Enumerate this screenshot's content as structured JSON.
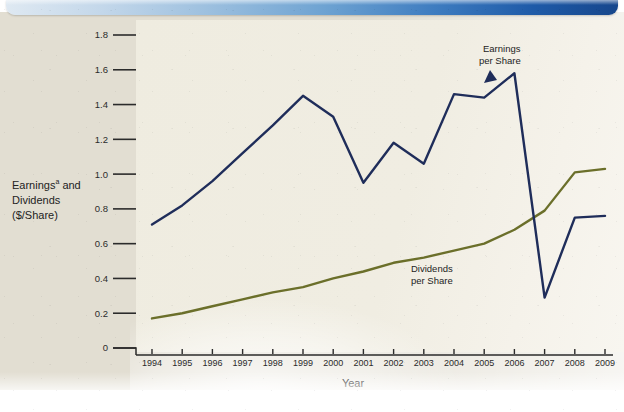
{
  "figure": {
    "banner_color_left": "#dfe9f2",
    "banner_color_right": "#16468c",
    "page_background": "#e2ded2",
    "plot_background": "#f0ede2"
  },
  "axes": {
    "y_title_line1": "Earnings",
    "y_title_superscript": "a",
    "y_title_line1_tail": " and",
    "y_title_line2": "Dividends",
    "y_title_line3": "($/Share)",
    "x_title": "Year",
    "y_ticks": [
      "0",
      "0.2",
      "0.4",
      "0.6",
      "0.8",
      "1.0",
      "1.2",
      "1.4",
      "1.6",
      "1.8"
    ],
    "x_ticks": [
      "1994",
      "1995",
      "1996",
      "1997",
      "1998",
      "1999",
      "2000",
      "2001",
      "2002",
      "2003",
      "2004",
      "2005",
      "2006",
      "2007",
      "2008",
      "2009"
    ]
  },
  "annotations": {
    "earnings_label_line1": "Earnings",
    "earnings_label_line2": "per Share",
    "dividends_label_line1": "Dividends",
    "dividends_label_line2": "per Share"
  },
  "chart_data": {
    "type": "line",
    "title": "",
    "xlabel": "Year",
    "ylabel": "Earnings and Dividends ($/Share)",
    "ylim": [
      0,
      1.8
    ],
    "ytick_step": 0.2,
    "grid": false,
    "legend": "inline-annotations",
    "x": [
      1994,
      1995,
      1996,
      1997,
      1998,
      1999,
      2000,
      2001,
      2002,
      2003,
      2004,
      2005,
      2006,
      2007,
      2008,
      2009
    ],
    "series": [
      {
        "name": "Earnings per Share",
        "color": "#1f2d5a",
        "values": [
          0.71,
          0.82,
          0.96,
          1.12,
          1.28,
          1.45,
          1.33,
          0.95,
          1.18,
          1.06,
          1.46,
          1.44,
          1.58,
          0.29,
          0.75,
          0.76
        ]
      },
      {
        "name": "Dividends per Share",
        "color": "#6b6f2a",
        "values": [
          0.17,
          0.2,
          0.24,
          0.28,
          0.32,
          0.35,
          0.4,
          0.44,
          0.49,
          0.52,
          0.56,
          0.6,
          0.68,
          0.79,
          1.01,
          1.03
        ]
      }
    ]
  }
}
